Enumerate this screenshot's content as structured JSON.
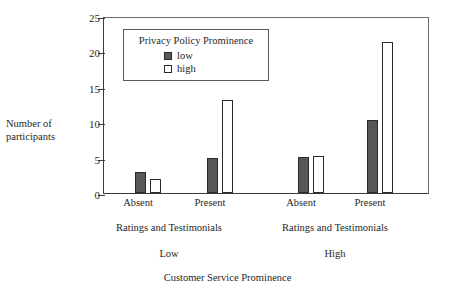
{
  "chart_data": {
    "type": "bar",
    "title": "",
    "xlabel": "Customer Service Prominence",
    "ylabel": "Number of\nparticipants",
    "ylabel_line1": "Number of",
    "ylabel_line2": "participants",
    "ylim": [
      0,
      25
    ],
    "yticks": [
      0,
      5,
      10,
      15,
      20,
      25
    ],
    "ytick_labels": [
      "0",
      "5",
      "10",
      "15",
      "20",
      "25"
    ],
    "grid": false,
    "legend": {
      "title": "Privacy Policy Prominence",
      "position": "upper-left-inside",
      "entries": [
        {
          "name": "low",
          "color": "#575757",
          "style": "filled"
        },
        {
          "name": "high",
          "color": "#ffffff",
          "style": "open"
        }
      ]
    },
    "categories": [
      "Absent",
      "Present",
      "Absent",
      "Present"
    ],
    "group_labels": [
      "Ratings and Testimonials",
      "Ratings and Testimonials"
    ],
    "super_group_labels": [
      "Low",
      "High"
    ],
    "series": [
      {
        "name": "low",
        "values": [
          3.0,
          4.9,
          5.1,
          10.3
        ]
      },
      {
        "name": "high",
        "values": [
          2.0,
          13.2,
          5.2,
          21.3
        ]
      }
    ],
    "panels": [
      {
        "super_group": "Low",
        "group_label": "Ratings and Testimonials",
        "bars": [
          {
            "category": "Absent",
            "series": "low",
            "value": 3.0
          },
          {
            "category": "Absent",
            "series": "high",
            "value": 2.0
          },
          {
            "category": "Present",
            "series": "low",
            "value": 4.9
          },
          {
            "category": "Present",
            "series": "high",
            "value": 13.2
          }
        ]
      },
      {
        "super_group": "High",
        "group_label": "Ratings and Testimonials",
        "bars": [
          {
            "category": "Absent",
            "series": "low",
            "value": 5.1
          },
          {
            "category": "Absent",
            "series": "high",
            "value": 5.2
          },
          {
            "category": "Present",
            "series": "low",
            "value": 10.3
          },
          {
            "category": "Present",
            "series": "high",
            "value": 21.3
          }
        ]
      }
    ]
  },
  "axes": {
    "y_title_line1": "Number of",
    "y_title_line2": "participants",
    "y_ticks": [
      "25",
      "20",
      "15",
      "10",
      "5",
      "0"
    ],
    "x_categories": [
      "Absent",
      "Present",
      "Absent",
      "Present"
    ],
    "x_group_labels": [
      "Ratings and Testimonials",
      "Ratings and Testimonials"
    ],
    "x_super_labels": [
      "Low",
      "High"
    ],
    "x_axis_title": "Customer Service Prominence"
  },
  "legend": {
    "title": "Privacy Policy Prominence",
    "low_label": "low",
    "high_label": "high"
  },
  "colors": {
    "bar_low_fill": "#575757",
    "bar_high_fill": "#ffffff",
    "bar_stroke": "#2b2b2b",
    "axis": "#3a3a3a",
    "frame": "#6a6a6a",
    "text": "#1f1f1f"
  }
}
